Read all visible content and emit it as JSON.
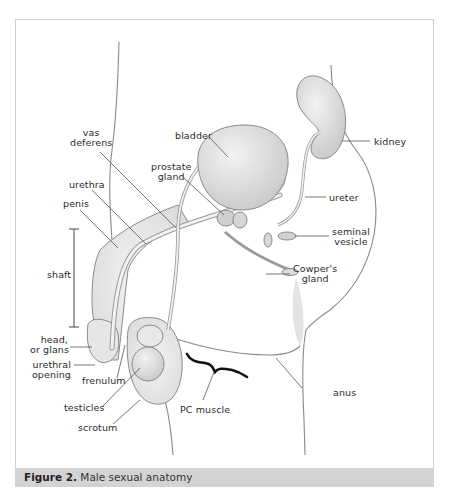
{
  "figure": {
    "number_label": "Figure 2.",
    "title": "Male sexual anatomy"
  },
  "labels": {
    "vas_deferens": "vas\ndeferens",
    "bladder": "bladder",
    "kidney": "kidney",
    "prostate_gland": "prostate\ngland",
    "ureter": "ureter",
    "urethra": "urethra",
    "penis": "penis",
    "seminal_vesicle": "seminal\nvesicle",
    "shaft": "shaft",
    "cowpers_gland": "Cowper's\ngland",
    "head_or_glans": "head,\nor glans",
    "urethral_opening": "urethral\nopening",
    "frenulum": "frenulum",
    "testicles": "testicles",
    "scrotum": "scrotum",
    "pc_muscle": "PC muscle",
    "anus": "anus"
  },
  "colors": {
    "caption_bar": "#d3d3d3",
    "frame_border": "#cfcfcf",
    "leader_line": "#555555",
    "pc_muscle_brace": "#111111"
  }
}
